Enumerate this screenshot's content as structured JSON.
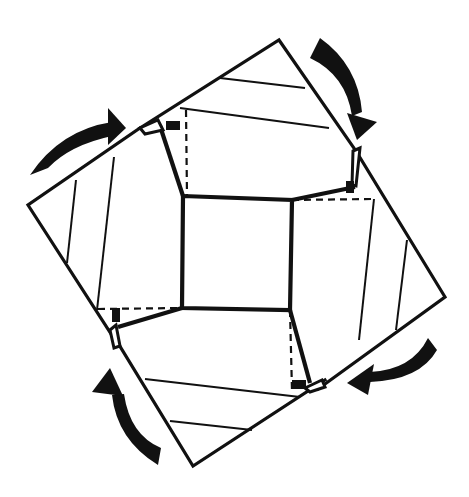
{
  "diagram": {
    "type": "origami-fold-instruction",
    "colors": {
      "line": "#111111",
      "background": "#ffffff",
      "arrow_fill": "#111111"
    },
    "elements": {
      "center_square": "central square",
      "flaps": [
        "top-flap",
        "right-flap",
        "bottom-flap",
        "left-flap"
      ],
      "arrows": [
        {
          "id": "arrow-top-left",
          "direction": "clockwise"
        },
        {
          "id": "arrow-top-right",
          "direction": "clockwise"
        },
        {
          "id": "arrow-bottom-right",
          "direction": "clockwise"
        },
        {
          "id": "arrow-bottom-left",
          "direction": "clockwise"
        }
      ],
      "fold_lines": "dashed valley folds at each flap corner",
      "tuck_marks": 4
    }
  }
}
